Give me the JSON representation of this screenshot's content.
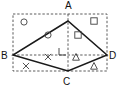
{
  "figure": {
    "canvas": {
      "width": 120,
      "height": 87
    },
    "vertices": [
      {
        "name": "A",
        "label": "A",
        "x": 68,
        "y": 21,
        "label_x": 65,
        "label_y": 9
      },
      {
        "name": "B",
        "label": "B",
        "x": 13,
        "y": 55,
        "label_x": 2,
        "label_y": 59
      },
      {
        "name": "C",
        "label": "C",
        "x": 68,
        "y": 71,
        "label_x": 62,
        "label_y": 85
      },
      {
        "name": "D",
        "label": "D",
        "x": 107,
        "y": 55,
        "label_x": 109,
        "label_y": 59
      }
    ],
    "bounding_rectangle": {
      "name": "outer-dashed-rectangle",
      "x": 13,
      "y": 14,
      "width": 94,
      "height": 57,
      "style": "dashed"
    },
    "rhombus": {
      "name": "rhombus-abcd",
      "points": "68,21 13,55 68,71 107,55",
      "style": "solid"
    },
    "diagonals": [
      {
        "name": "diagonal-ac",
        "x1": 68,
        "y1": 14,
        "x2": 68,
        "y2": 71,
        "style": "dashed"
      },
      {
        "name": "diagonal-bd",
        "x1": 13,
        "y1": 55,
        "x2": 107,
        "y2": 55,
        "style": "dashed"
      }
    ],
    "right_angle": {
      "name": "right-angle-mark-center",
      "x": 59,
      "y": 48,
      "size": 6,
      "path": "M 59 48 L 59 55 L 66 55"
    },
    "quadrant_markers": [
      {
        "quadrant": "top-left",
        "glyph": "circle",
        "icon_name": "circle-marker-icon",
        "count": 2,
        "items": [
          {
            "cx": 24,
            "cy": 22,
            "r": 3.1
          },
          {
            "cx": 48,
            "cy": 35,
            "r": 3.1
          }
        ]
      },
      {
        "quadrant": "top-right",
        "glyph": "square",
        "icon_name": "square-marker-icon",
        "count": 2,
        "items": [
          {
            "cx": 94,
            "cy": 21,
            "size": 6.4
          },
          {
            "cx": 78,
            "cy": 35,
            "size": 6.4
          }
        ]
      },
      {
        "quadrant": "bottom-left",
        "glyph": "x",
        "icon_name": "x-marker-icon",
        "count": 2,
        "items": [
          {
            "cx": 48,
            "cy": 57,
            "size": 6.2
          },
          {
            "cx": 26,
            "cy": 66,
            "size": 6.2
          }
        ]
      },
      {
        "quadrant": "bottom-right",
        "glyph": "triangle",
        "icon_name": "triangle-marker-icon",
        "count": 2,
        "items": [
          {
            "cx": 76,
            "cy": 57,
            "size": 6.4
          },
          {
            "cx": 94,
            "cy": 66,
            "size": 6.4
          }
        ]
      }
    ],
    "colors": {
      "background": "#ffffff",
      "solid_stroke": "#1a1a1a",
      "dashed_stroke": "#4a4a4a",
      "marker_stroke": "#3f3f3f",
      "label_text": "#111111"
    }
  }
}
